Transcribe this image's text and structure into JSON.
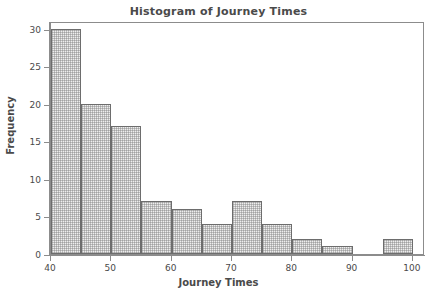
{
  "chart_data": {
    "type": "bar",
    "title": "Histogram of Journey Times",
    "xlabel": "Journey Times",
    "ylabel": "Frequency",
    "xlim": [
      40,
      102
    ],
    "ylim": [
      0,
      31
    ],
    "bin_width": 5,
    "grid": false,
    "legend": null,
    "categories": [
      "40-45",
      "45-50",
      "50-55",
      "55-60",
      "60-65",
      "65-70",
      "70-75",
      "75-80",
      "80-85",
      "85-90",
      "90-95",
      "95-100"
    ],
    "bin_edges": [
      40,
      45,
      50,
      55,
      60,
      65,
      70,
      75,
      80,
      85,
      90,
      95,
      100
    ],
    "values": [
      30,
      20,
      17,
      7,
      6,
      4,
      7,
      4,
      2,
      1,
      0,
      2
    ],
    "xticks": [
      40,
      50,
      60,
      70,
      80,
      90,
      100
    ],
    "xtick_labels": [
      "40",
      "50",
      "60",
      "70",
      "80",
      "90",
      "100"
    ],
    "yticks": [
      0,
      5,
      10,
      15,
      20,
      25,
      30
    ],
    "ytick_labels": [
      "0",
      "5",
      "10",
      "15",
      "20",
      "25",
      "30"
    ],
    "bar_fill_color": "#eeeeee",
    "bar_edge_color": "#6d6d6d",
    "axis_color": "#8c8c8c",
    "text_color": "#4a4a4a",
    "background_color": "#ffffff"
  }
}
